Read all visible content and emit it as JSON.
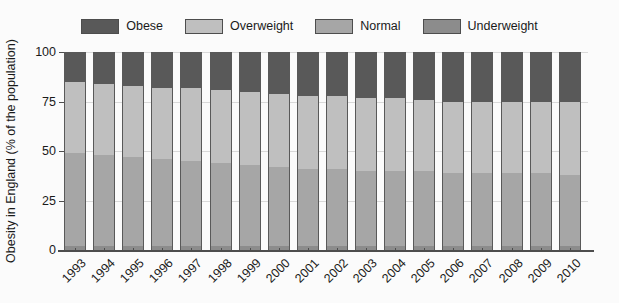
{
  "chart_data": {
    "type": "bar",
    "subtype": "stacked-bar-percent",
    "title": "",
    "xlabel": "",
    "ylabel": "Obesity in England (% of the population)",
    "ylim": [
      0,
      100
    ],
    "yticks": [
      0,
      25,
      50,
      75,
      100
    ],
    "grid": true,
    "legend_position": "top-center",
    "stack_order_bottom_to_top": [
      "Underweight",
      "Normal",
      "Overweight",
      "Obese"
    ],
    "categories": [
      "1993",
      "1994",
      "1995",
      "1996",
      "1997",
      "1998",
      "1999",
      "2000",
      "2001",
      "2002",
      "2003",
      "2004",
      "2005",
      "2006",
      "2007",
      "2008",
      "2009",
      "2010"
    ],
    "series": [
      {
        "name": "Underweight",
        "color": "#8c8c8c",
        "values": [
          2,
          2,
          2,
          2,
          2,
          2,
          2,
          2,
          2,
          2,
          2,
          2,
          2,
          2,
          2,
          2,
          2,
          2
        ]
      },
      {
        "name": "Normal",
        "color": "#a6a6a6",
        "values": [
          47,
          46,
          45,
          44,
          43,
          42,
          41,
          40,
          39,
          39,
          38,
          38,
          38,
          37,
          37,
          37,
          37,
          36
        ]
      },
      {
        "name": "Overweight",
        "color": "#bfbfbf",
        "values": [
          36,
          36,
          36,
          36,
          37,
          37,
          37,
          37,
          37,
          37,
          37,
          37,
          36,
          36,
          36,
          36,
          36,
          37
        ]
      },
      {
        "name": "Obese",
        "color": "#595959",
        "values": [
          15,
          16,
          17,
          18,
          18,
          19,
          20,
          21,
          22,
          22,
          23,
          23,
          24,
          25,
          25,
          25,
          25,
          25
        ]
      }
    ]
  },
  "legend": {
    "entries": [
      {
        "label": "Obese",
        "color": "#595959"
      },
      {
        "label": "Overweight",
        "color": "#bfbfbf"
      },
      {
        "label": "Normal",
        "color": "#a6a6a6"
      },
      {
        "label": "Underweight",
        "color": "#8c8c8c"
      }
    ]
  },
  "axes": {
    "y_title": "Obesity in England (% of the population)",
    "y_tick_labels": [
      "100",
      "75",
      "50",
      "25",
      "0"
    ],
    "x_tick_labels": [
      "1993",
      "1994",
      "1995",
      "1996",
      "1997",
      "1998",
      "1999",
      "2000",
      "2001",
      "2002",
      "2003",
      "2004",
      "2005",
      "2006",
      "2007",
      "2008",
      "2009",
      "2010"
    ]
  },
  "style": {
    "background": "#fbfbfb",
    "grid_color": "#d9d9d9",
    "axis_color": "#4d4d4d",
    "bar_edge_color": "#595959"
  }
}
